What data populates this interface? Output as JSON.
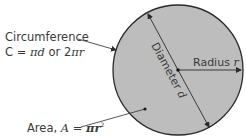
{
  "diagram": {
    "type": "circle-anatomy",
    "colors": {
      "circle_fill": "#bdbdbd",
      "circle_stroke": "#2b2b2b",
      "line": "#2b2b2b",
      "text": "#3a3a3a",
      "background": "#ffffff"
    },
    "circumference": {
      "label": "Circumference",
      "formula_prefix": "C = ",
      "formula_a": "πd",
      "formula_mid": " or 2",
      "formula_b": "πr"
    },
    "diameter": {
      "label_word": "Diameter ",
      "label_var": "d"
    },
    "radius": {
      "label_word": "Radius ",
      "label_var": "r"
    },
    "area": {
      "label_prefix": "Area, ",
      "label_var": "A",
      "label_eq": " = ",
      "label_formula": "πr",
      "label_exp": "2"
    }
  }
}
